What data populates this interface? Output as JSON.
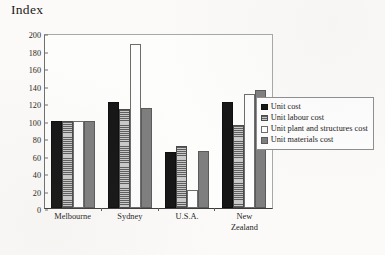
{
  "chart_data": {
    "type": "bar",
    "title": "",
    "ylabel": "Index",
    "xlabel": "",
    "ylim": [
      0,
      200
    ],
    "ytick_step": 20,
    "yticks": [
      0,
      20,
      40,
      60,
      80,
      100,
      120,
      140,
      160,
      180,
      200
    ],
    "grid": false,
    "legend_position": "right",
    "categories": [
      "Melbourne",
      "Sydney",
      "U.S.A.",
      "New Zealand"
    ],
    "category_lines": [
      [
        "Melbourne"
      ],
      [
        "Sydney"
      ],
      [
        "U.S.A."
      ],
      [
        "New",
        "Zealand"
      ]
    ],
    "series": [
      {
        "name": "Unit cost",
        "fill": "solid-black",
        "color": "#151515",
        "values": [
          100,
          121,
          64,
          121
        ]
      },
      {
        "name": "Unit labour cost",
        "fill": "horizontal-hatch",
        "color": "#8e8e8e",
        "values": [
          100,
          113,
          71,
          95
        ]
      },
      {
        "name": "Unit plant and structures cost",
        "fill": "white",
        "color": "#fdfdfd",
        "values": [
          100,
          188,
          21,
          130
        ]
      },
      {
        "name": "Unit materials cost",
        "fill": "solid-gray",
        "color": "#7e7e7e",
        "values": [
          100,
          114,
          65,
          135
        ]
      }
    ]
  }
}
